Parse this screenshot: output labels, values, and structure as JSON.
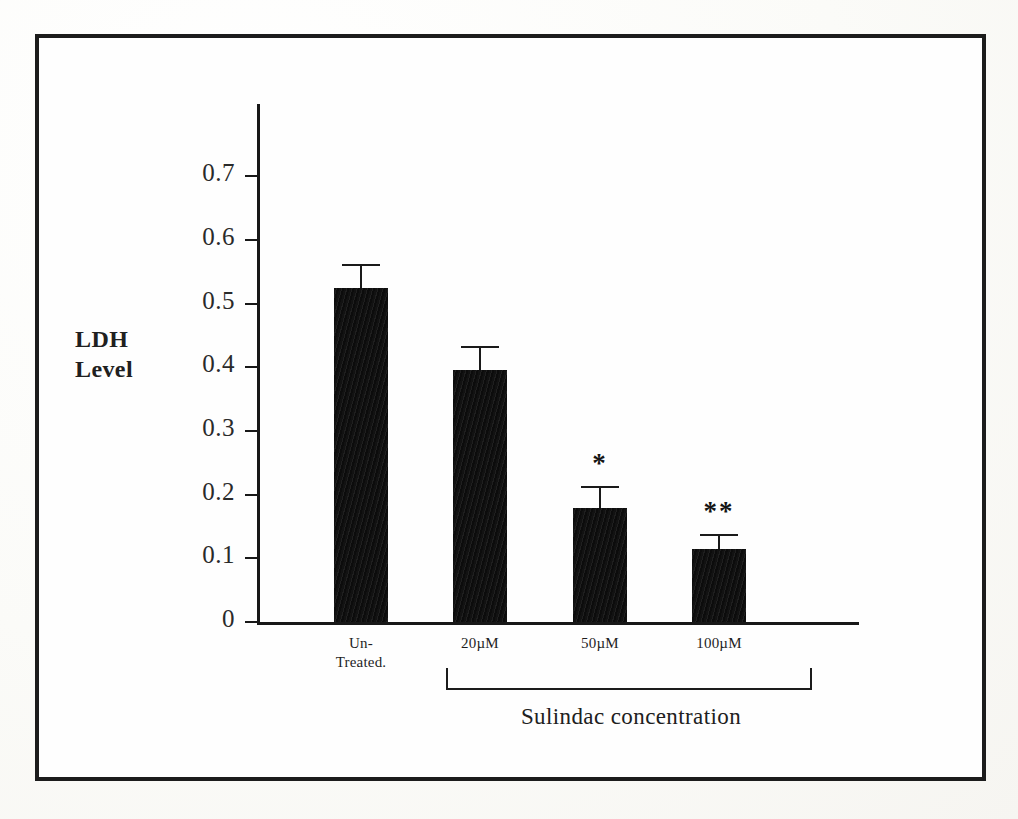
{
  "figure": {
    "kind": "scanned-bar-chart",
    "frame_color": "#1c1c1c",
    "background_color": "#fefefe",
    "bar_color": "#141414"
  },
  "axis_title": {
    "line1": "LDH",
    "line2": "Level"
  },
  "group_label": "Sulindac concentration",
  "y_ticks": [
    {
      "label": "0.7",
      "value": 0.7
    },
    {
      "label": "0.6",
      "value": 0.6
    },
    {
      "label": "0.5",
      "value": 0.5
    },
    {
      "label": "0.4",
      "value": 0.4
    },
    {
      "label": "0.3",
      "value": 0.3
    },
    {
      "label": "0.2",
      "value": 0.2
    },
    {
      "label": "0.1",
      "value": 0.1
    },
    {
      "label": "0",
      "value": 0.0
    }
  ],
  "bars": [
    {
      "category_line1": "Un-",
      "category_line2": "Treated.",
      "value": 0.525,
      "error": 0.037,
      "significance": ""
    },
    {
      "category_line1": "20µM",
      "category_line2": "",
      "value": 0.396,
      "error": 0.037,
      "significance": ""
    },
    {
      "category_line1": "50µM",
      "category_line2": "",
      "value": 0.179,
      "error": 0.035,
      "significance": "*"
    },
    {
      "category_line1": "100µM",
      "category_line2": "",
      "value": 0.114,
      "error": 0.024,
      "significance": "**"
    }
  ],
  "chart_data": {
    "type": "bar",
    "title": "",
    "subtitle": "",
    "xlabel": "Sulindac concentration",
    "ylabel": "LDH Level",
    "categories": [
      "Un-Treated.",
      "20µM",
      "50µM",
      "100µM"
    ],
    "values": [
      0.525,
      0.396,
      0.179,
      0.114
    ],
    "errors": [
      0.037,
      0.037,
      0.035,
      0.024
    ],
    "error_type": "symmetric-error-bars",
    "annotations": [
      {
        "category": "50µM",
        "text": "*"
      },
      {
        "category": "100µM",
        "text": "**"
      }
    ],
    "ylim": [
      0,
      0.78
    ],
    "ytick_values": [
      0,
      0.1,
      0.2,
      0.3,
      0.4,
      0.5,
      0.6,
      0.7
    ],
    "ytick_labels": [
      "0",
      "0.1",
      "0.2",
      "0.3",
      "0.4",
      "0.5",
      "0.6",
      "0.7"
    ],
    "grid": false,
    "legend": false,
    "legend_position": "none",
    "bar_color": "#141414",
    "group_bracket": {
      "label": "Sulindac concentration",
      "spans_categories": [
        "20µM",
        "50µM",
        "100µM"
      ]
    }
  }
}
